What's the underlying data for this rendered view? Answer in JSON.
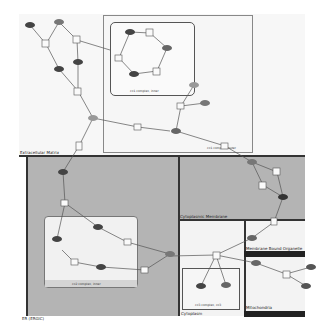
{
  "compartments": {
    "extracellular": "Extracellular Matrix",
    "er": "ER (ERGIC)",
    "cyto_membrane": "Cytoplasmic Membrane",
    "membrane_organelle": "Membrane Bound Organelle",
    "cytoplasm": "Cytoplasm",
    "mitochondria": "Mitochondria"
  },
  "complexes": {
    "top_inner": "cx1 complex, inner",
    "top_outer": "cx1 complex, outer",
    "er_inner": "cx2 complex, inner",
    "cyto_inner": "cx3 complex, cx3"
  },
  "node_label": "RS2",
  "colors": {
    "background": "#f7f7f7",
    "gray_region": "#b4b4b4",
    "white_region": "#f3f3f3",
    "border": "#333333",
    "node_dark": "#444444",
    "node_light": "#8a8a8a",
    "dark_bar": "#222222"
  }
}
